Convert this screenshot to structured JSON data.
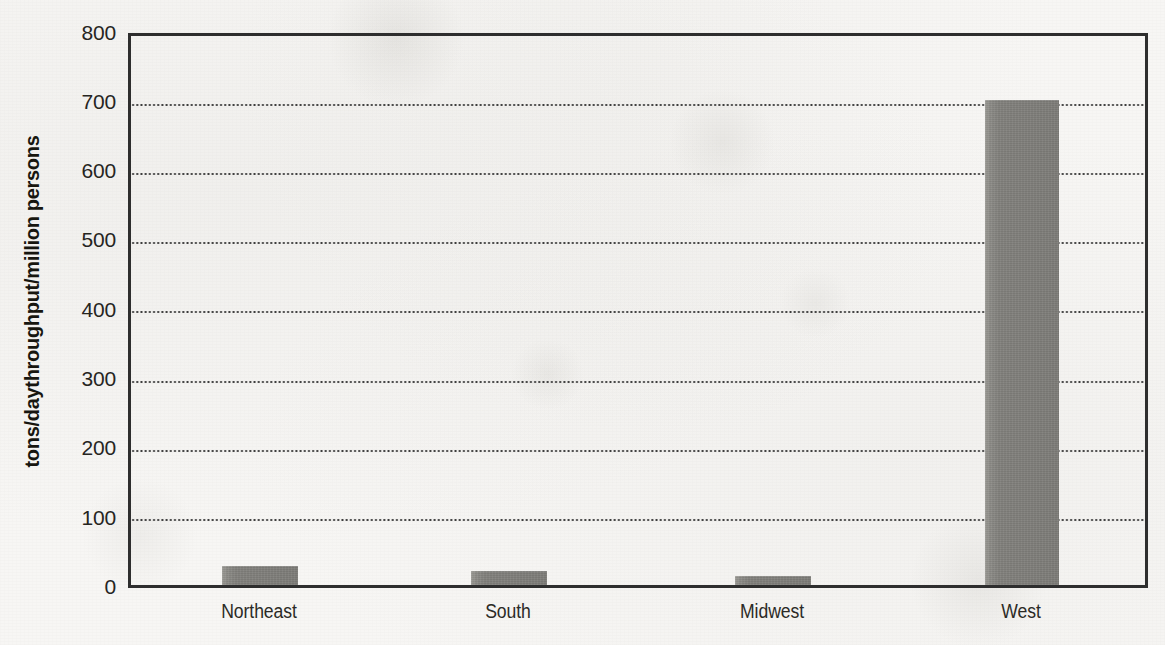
{
  "chart_data": {
    "type": "bar",
    "title": "",
    "subtitle": "",
    "xlabel": "",
    "ylabel": "tons/daythroughput/million persons",
    "categories": [
      "Northeast",
      "South",
      "Midwest",
      "West"
    ],
    "values": [
      28,
      20,
      13,
      707
    ],
    "ylim": [
      0,
      800
    ],
    "yticks": [
      0,
      100,
      200,
      300,
      400,
      500,
      600,
      700,
      800
    ],
    "ytick_labels": [
      "0",
      "100",
      "200",
      "300",
      "400",
      "500",
      "600",
      "700",
      "800"
    ],
    "grid": "horizontal-dotted",
    "legend": "none",
    "bar_color": "#7e7d79",
    "axis_color": "#2e2e2e",
    "background_color": "#f7f6f4",
    "annotations": []
  },
  "axis": {
    "y": {
      "label": "tons/daythroughput/million persons",
      "ticks": [
        {
          "value": 800,
          "label": "800"
        },
        {
          "value": 700,
          "label": "700"
        },
        {
          "value": 600,
          "label": "600"
        },
        {
          "value": 500,
          "label": "500"
        },
        {
          "value": 400,
          "label": "400"
        },
        {
          "value": 300,
          "label": "300"
        },
        {
          "value": 200,
          "label": "200"
        },
        {
          "value": 100,
          "label": "100"
        },
        {
          "value": 0,
          "label": "0"
        }
      ]
    },
    "x": {
      "ticks": [
        {
          "label": "Northeast"
        },
        {
          "label": "South"
        },
        {
          "label": "Midwest"
        },
        {
          "label": "West"
        }
      ]
    }
  }
}
